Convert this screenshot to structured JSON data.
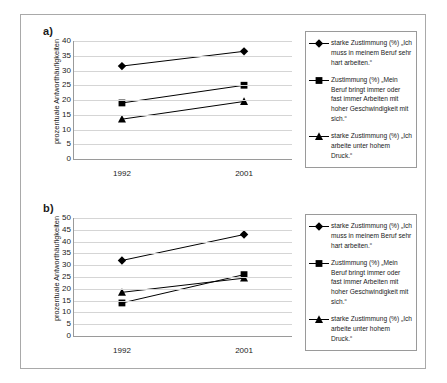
{
  "figure": {
    "panels": [
      {
        "label": "a)",
        "ylabel": "prozentuale Antworthäufigkeiten",
        "yticks": [
          0,
          5,
          10,
          15,
          20,
          25,
          30,
          35,
          40
        ],
        "xticks": [
          "1992",
          "2001"
        ]
      },
      {
        "label": "b)",
        "ylabel": "prozentuale Antworthäufigkeiten",
        "yticks": [
          0,
          5,
          10,
          15,
          20,
          25,
          30,
          35,
          40,
          45,
          50
        ],
        "xticks": [
          "1992",
          "2001"
        ]
      }
    ],
    "legend": [
      {
        "marker": "diamond-marker-icon",
        "text": "starke Zustimmung (%) „Ich muss in meinem Beruf sehr hart arbeiten.“"
      },
      {
        "marker": "square-marker-icon",
        "text": "Zustimmung (%) „Mein Beruf bringt immer oder fast immer Arbeiten mit hoher Geschwindigkeit mit sich.“"
      },
      {
        "marker": "triangle-marker-icon",
        "text": "starke Zustimmung (%) „Ich arbeite unter hohem Druck.“"
      }
    ]
  },
  "chart_data": [
    {
      "type": "line",
      "title": "a)",
      "xlabel": "",
      "ylabel": "prozentuale Antworthäufigkeiten",
      "categories": [
        "1992",
        "2001"
      ],
      "ylim": [
        0,
        40
      ],
      "ytick_step": 5,
      "grid": true,
      "legend_position": "right",
      "series": [
        {
          "name": "starke Zustimmung (%) „Ich muss in meinem Beruf sehr hart arbeiten.“",
          "marker": "diamond",
          "values": [
            31.5,
            36.5
          ]
        },
        {
          "name": "Zustimmung (%) „Mein Beruf bringt immer oder fast immer Arbeiten mit hoher Geschwindigkeit mit sich.“",
          "marker": "square",
          "values": [
            19,
            25
          ]
        },
        {
          "name": "starke Zustimmung (%) „Ich arbeite unter hohem Druck.“",
          "marker": "triangle",
          "values": [
            13.5,
            19.5
          ]
        }
      ]
    },
    {
      "type": "line",
      "title": "b)",
      "xlabel": "",
      "ylabel": "prozentuale Antworthäufigkeiten",
      "categories": [
        "1992",
        "2001"
      ],
      "ylim": [
        0,
        50
      ],
      "ytick_step": 5,
      "grid": true,
      "legend_position": "right",
      "series": [
        {
          "name": "starke Zustimmung (%) „Ich muss in meinem Beruf sehr hart arbeiten.“",
          "marker": "diamond",
          "values": [
            32,
            43
          ]
        },
        {
          "name": "Zustimmung (%) „Mein Beruf bringt immer oder fast immer Arbeiten mit hoher Geschwindigkeit mit sich.“",
          "marker": "square",
          "values": [
            14,
            26
          ]
        },
        {
          "name": "starke Zustimmung (%) „Ich arbeite unter hohem Druck.“",
          "marker": "triangle",
          "values": [
            18.5,
            24.5
          ]
        }
      ]
    }
  ],
  "colors": {
    "series": "#000000",
    "grid": "#d5d5d5",
    "axis": "#9a9a9a",
    "frame": "#a9a9a9",
    "background": "#ffffff"
  }
}
